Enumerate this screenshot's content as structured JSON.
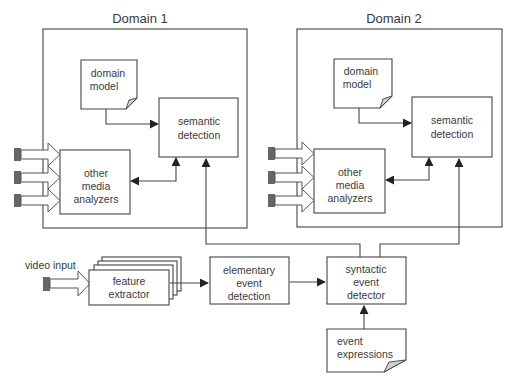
{
  "diagram": {
    "domains": [
      {
        "title": "Domain 1",
        "nodes": {
          "domain_model": [
            "domain",
            "model"
          ],
          "semantic_detection": [
            "semantic",
            "detection"
          ],
          "other_media_analyzers": [
            "other",
            "media",
            "analyzers"
          ]
        }
      },
      {
        "title": "Domain 2",
        "nodes": {
          "domain_model": [
            "domain",
            "model"
          ],
          "semantic_detection": [
            "semantic",
            "detection"
          ],
          "other_media_analyzers": [
            "other",
            "media",
            "analyzers"
          ]
        }
      }
    ],
    "pipeline": {
      "input_label": "video input",
      "feature_extractor": [
        "feature",
        "extractor"
      ],
      "elementary_event_detection": [
        "elementary",
        "event",
        "detection"
      ],
      "syntactic_event_detector": [
        "syntactic",
        "event",
        "detector"
      ],
      "event_expressions": [
        "event",
        "expressions"
      ]
    },
    "edges": [
      {
        "from": "video input",
        "to": "feature extractor"
      },
      {
        "from": "feature extractor",
        "to": "elementary event detection"
      },
      {
        "from": "elementary event detection",
        "to": "syntactic event detector"
      },
      {
        "from": "event expressions",
        "to": "syntactic event detector"
      },
      {
        "from": "syntactic event detector",
        "to": "Domain 1 semantic detection"
      },
      {
        "from": "syntactic event detector",
        "to": "Domain 2 semantic detection"
      },
      {
        "from": "domain model",
        "to": "semantic detection"
      },
      {
        "from": "other media analyzers",
        "to": "semantic detection",
        "bidirectional": true
      }
    ],
    "icons": {
      "media_input": "media-input-arrow-icon",
      "document": "document-icon"
    }
  }
}
